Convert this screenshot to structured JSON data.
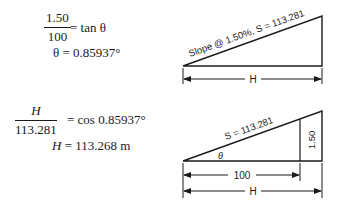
{
  "equations": {
    "top": {
      "fraction_numerator": "1.50",
      "fraction_denominator": "100",
      "rhs": "= tan θ",
      "result": "θ = 0.85937°"
    },
    "bottom": {
      "fraction_numerator": "H",
      "fraction_denominator": "113.281",
      "rhs": "= cos 0.85937°",
      "result_lhs": "H",
      "result_rhs": "= 113.268 m"
    }
  },
  "diagrams": {
    "top": {
      "slope_label": "Slope @ 1.50%, S = 113.281",
      "horizontal_label": "H"
    },
    "bottom": {
      "slope_label": "S = 113.281",
      "angle_label": "θ",
      "rise_label": "1.50",
      "run_label": "100",
      "horizontal_label": "H"
    }
  }
}
